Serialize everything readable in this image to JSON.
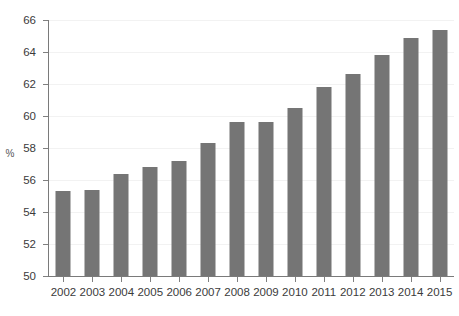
{
  "chart_data": {
    "type": "bar",
    "title": "",
    "subtitle": "",
    "xlabel": "",
    "ylabel": "%",
    "categories": [
      "2002",
      "2003",
      "2004",
      "2005",
      "2006",
      "2007",
      "2008",
      "2009",
      "2010",
      "2011",
      "2012",
      "2013",
      "2014",
      "2015"
    ],
    "values": [
      55.3,
      55.4,
      56.4,
      56.8,
      57.2,
      58.3,
      59.6,
      59.6,
      60.5,
      61.8,
      62.6,
      63.8,
      64.9,
      65.4
    ],
    "series": [
      {
        "name": "",
        "values": [
          55.3,
          55.4,
          56.4,
          56.8,
          57.2,
          58.3,
          59.6,
          59.6,
          60.5,
          61.8,
          62.6,
          63.8,
          64.9,
          65.4
        ]
      }
    ],
    "ylim": [
      50,
      66
    ],
    "yticks": [
      50,
      52,
      54,
      56,
      58,
      60,
      62,
      64,
      66
    ],
    "ytick_labels": [
      "50",
      "52",
      "54",
      "56",
      "58",
      "60",
      "62",
      "64",
      "66"
    ],
    "grid": true,
    "grid_axis": "y",
    "legend": false,
    "legend_position": "none",
    "bar_color": "#757575",
    "axis_color": "#7a7a7a",
    "grid_color": "#f2f2f2",
    "text_color": "#3b3b3b",
    "background": "#ffffff"
  }
}
